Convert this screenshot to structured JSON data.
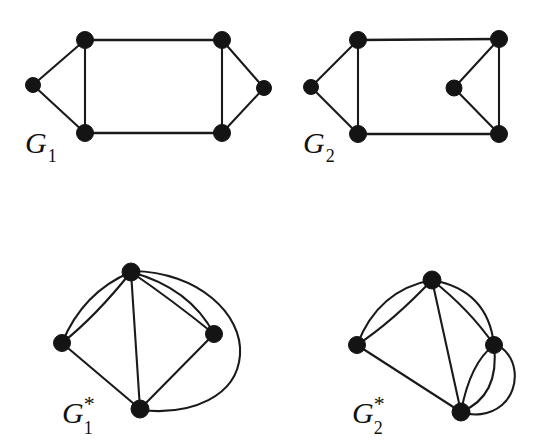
{
  "figure": {
    "background_color": "#ffffff",
    "ink_color": "#141414"
  },
  "labels": {
    "g1": {
      "base": "G",
      "sub": "1",
      "sup": ""
    },
    "g2": {
      "base": "G",
      "sub": "2",
      "sup": ""
    },
    "g1star": {
      "base": "G",
      "sub": "1",
      "sup": "*"
    },
    "g2star": {
      "base": "G",
      "sub": "2",
      "sup": "*"
    }
  },
  "graphs": [
    {
      "id": "G1",
      "name": "graph-g1",
      "label": "G1",
      "vertex_count": 6,
      "edge_count": 7,
      "vertices": [
        {
          "id": "a",
          "x": 33,
          "y": 85,
          "r": 7.5
        },
        {
          "id": "b",
          "x": 85,
          "y": 40,
          "r": 8.5
        },
        {
          "id": "c",
          "x": 85,
          "y": 133,
          "r": 8.5
        },
        {
          "id": "d",
          "x": 222,
          "y": 40,
          "r": 8.5
        },
        {
          "id": "e",
          "x": 222,
          "y": 133,
          "r": 8.5
        },
        {
          "id": "f",
          "x": 264,
          "y": 88,
          "r": 7.5
        }
      ],
      "edges": [
        [
          "a",
          "b"
        ],
        [
          "a",
          "c"
        ],
        [
          "b",
          "c"
        ],
        [
          "b",
          "d"
        ],
        [
          "c",
          "e"
        ],
        [
          "d",
          "e"
        ],
        [
          "d",
          "f"
        ],
        [
          "e",
          "f"
        ]
      ]
    },
    {
      "id": "G2",
      "name": "graph-g2",
      "label": "G2",
      "vertex_count": 6,
      "edge_count": 7,
      "vertices": [
        {
          "id": "a",
          "x": 311,
          "y": 87,
          "r": 7.5
        },
        {
          "id": "b",
          "x": 358,
          "y": 40,
          "r": 8.5
        },
        {
          "id": "c",
          "x": 358,
          "y": 134,
          "r": 8.5
        },
        {
          "id": "g",
          "x": 454,
          "y": 88,
          "r": 8.0
        },
        {
          "id": "d",
          "x": 499,
          "y": 39,
          "r": 8.5
        },
        {
          "id": "e",
          "x": 499,
          "y": 134,
          "r": 8.5
        }
      ],
      "edges": [
        [
          "a",
          "b"
        ],
        [
          "a",
          "c"
        ],
        [
          "b",
          "c"
        ],
        [
          "b",
          "d"
        ],
        [
          "c",
          "e"
        ],
        [
          "d",
          "e"
        ],
        [
          "d",
          "g"
        ],
        [
          "e",
          "g"
        ]
      ]
    },
    {
      "id": "G1*",
      "name": "graph-g1-star",
      "label": "G1*",
      "vertex_count": 4,
      "edge_count": 8,
      "vertices": [
        {
          "id": "t",
          "x": 131,
          "y": 272,
          "r": 9.0
        },
        {
          "id": "l",
          "x": 62,
          "y": 343,
          "r": 8.5
        },
        {
          "id": "r",
          "x": 214,
          "y": 334,
          "r": 8.5
        },
        {
          "id": "b",
          "x": 140,
          "y": 409,
          "r": 9.0
        }
      ],
      "edges": [
        {
          "from": "t",
          "to": "l",
          "curve": "upper",
          "multiplicity_index": 1
        },
        {
          "from": "t",
          "to": "l",
          "curve": "lower",
          "multiplicity_index": 2
        },
        {
          "from": "t",
          "to": "r",
          "curve": "upper",
          "multiplicity_index": 1
        },
        {
          "from": "t",
          "to": "r",
          "curve": "lower",
          "multiplicity_index": 2
        },
        {
          "from": "t",
          "to": "b",
          "curve": "straight",
          "multiplicity_index": 1
        },
        {
          "from": "t",
          "to": "b",
          "curve": "outer-arc-right",
          "multiplicity_index": 2
        },
        {
          "from": "l",
          "to": "b",
          "curve": "straight",
          "multiplicity_index": 1
        },
        {
          "from": "r",
          "to": "b",
          "curve": "straight",
          "multiplicity_index": 1
        }
      ]
    },
    {
      "id": "G2*",
      "name": "graph-g2-star",
      "label": "G2*",
      "vertex_count": 4,
      "edge_count": 8,
      "vertices": [
        {
          "id": "t",
          "x": 432,
          "y": 280,
          "r": 9.0
        },
        {
          "id": "l",
          "x": 357,
          "y": 345,
          "r": 8.5
        },
        {
          "id": "r",
          "x": 494,
          "y": 345,
          "r": 8.5
        },
        {
          "id": "b",
          "x": 461,
          "y": 412,
          "r": 9.0
        }
      ],
      "edges": [
        {
          "from": "t",
          "to": "l",
          "curve": "upper",
          "multiplicity_index": 1
        },
        {
          "from": "t",
          "to": "l",
          "curve": "lower",
          "multiplicity_index": 2
        },
        {
          "from": "t",
          "to": "r",
          "curve": "upper",
          "multiplicity_index": 1
        },
        {
          "from": "t",
          "to": "r",
          "curve": "lower",
          "multiplicity_index": 2
        },
        {
          "from": "t",
          "to": "b",
          "curve": "straight",
          "multiplicity_index": 1
        },
        {
          "from": "l",
          "to": "b",
          "curve": "straight",
          "multiplicity_index": 1
        },
        {
          "from": "r",
          "to": "b",
          "curve": "inner",
          "multiplicity_index": 1
        },
        {
          "from": "r",
          "to": "b",
          "curve": "outer",
          "multiplicity_index": 2
        }
      ]
    }
  ]
}
